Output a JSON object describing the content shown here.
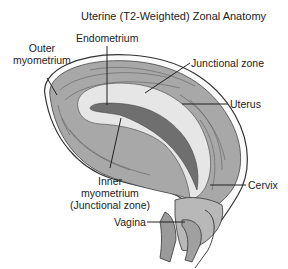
{
  "title": "Uterine (T2-Weighted) Zonal Anatomy",
  "labels": {
    "endometrium": "Endometrium",
    "outer_myometrium_1": "Outer",
    "outer_myometrium_2": "myometrium",
    "junctional_zone": "Junctional zone",
    "uterus": "Uterus",
    "inner_myometrium_1": "Inner",
    "inner_myometrium_2": "myometrium",
    "inner_myometrium_3": "(Junctional zone)",
    "cervix": "Cervix",
    "vagina": "Vagina"
  },
  "colors": {
    "outer_myometrium": "#a8a8a8",
    "junctional_zone": "#e6e6e6",
    "endometrium": "#6f6f6f",
    "outline": "#333333",
    "background": "#ffffff"
  }
}
